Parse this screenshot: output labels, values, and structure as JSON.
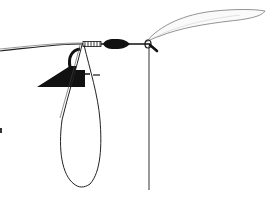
{
  "diagram": {
    "type": "knot-illustration",
    "colors": {
      "background": "#ffffff",
      "ink": "#111111",
      "feather": "#777777"
    },
    "elements": [
      {
        "id": "main-line",
        "label": "leader line"
      },
      {
        "id": "wraps",
        "label": "wrapped section"
      },
      {
        "id": "black-body",
        "label": "thread body"
      },
      {
        "id": "hook-eye",
        "label": "hook eye"
      },
      {
        "id": "feather-wing",
        "label": "feather wing"
      },
      {
        "id": "tag-end",
        "label": "vertical tag line"
      },
      {
        "id": "loop",
        "label": "loop"
      },
      {
        "id": "tool",
        "label": "black triangular tool"
      }
    ]
  }
}
